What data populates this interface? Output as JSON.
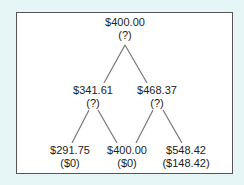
{
  "diagram": {
    "type": "binomial-tree",
    "levels": 3,
    "nodes": [
      {
        "id": "root",
        "value": "$400.00",
        "payoff": "(?)",
        "x": 125,
        "y": 17
      },
      {
        "id": "down",
        "value": "$341.61",
        "payoff": "(?)",
        "x": 93,
        "y": 84
      },
      {
        "id": "up",
        "value": "$468.37",
        "payoff": "(?)",
        "x": 157,
        "y": 84
      },
      {
        "id": "dd",
        "value": "$291.75",
        "payoff": "($0)",
        "x": 70,
        "y": 144
      },
      {
        "id": "ud",
        "value": "$400.00",
        "payoff": "($0)",
        "x": 128,
        "y": 144
      },
      {
        "id": "uu",
        "value": "$548.42",
        "payoff": "($148.42)",
        "x": 187,
        "y": 144
      }
    ],
    "edges": [
      {
        "from": "root",
        "to": "down"
      },
      {
        "from": "root",
        "to": "up"
      },
      {
        "from": "down",
        "to": "dd"
      },
      {
        "from": "down",
        "to": "ud"
      },
      {
        "from": "up",
        "to": "ud"
      },
      {
        "from": "up",
        "to": "uu"
      }
    ],
    "colors": {
      "background": "#e6f6f7",
      "panel": "#ffffff",
      "border": "#555555",
      "edge": "#777777",
      "text": "#222222"
    }
  }
}
